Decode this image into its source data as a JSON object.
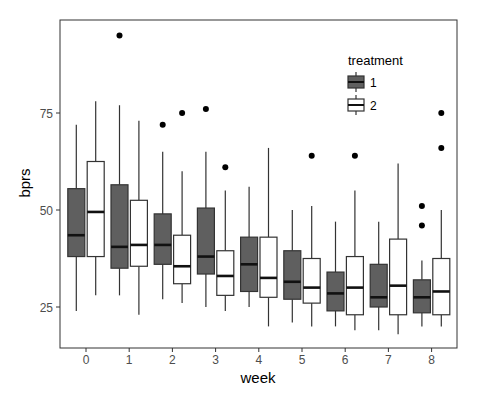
{
  "chart_data": {
    "type": "boxplot",
    "title": "",
    "xlabel": "week",
    "ylabel": "bprs",
    "categories": [
      "0",
      "1",
      "2",
      "3",
      "4",
      "5",
      "6",
      "7",
      "8"
    ],
    "y_ticks": [
      25,
      50,
      75
    ],
    "ylim": [
      15,
      100
    ],
    "grid": false,
    "legend": {
      "title": "treatment",
      "position": "top-right-inside",
      "entries": [
        {
          "label": "1",
          "fill": "#5f5f5f"
        },
        {
          "label": "2",
          "fill": "#ffffff"
        }
      ]
    },
    "series": [
      {
        "name": "1",
        "fill": "#5f5f5f",
        "boxes": [
          {
            "week": "0",
            "whisker_low": 24,
            "q1": 38,
            "median": 43.5,
            "q3": 55.5,
            "whisker_high": 72,
            "outliers": []
          },
          {
            "week": "1",
            "whisker_low": 28,
            "q1": 35,
            "median": 40.5,
            "q3": 56.5,
            "whisker_high": 77,
            "outliers": [
              95
            ]
          },
          {
            "week": "2",
            "whisker_low": 27,
            "q1": 36,
            "median": 41,
            "q3": 49,
            "whisker_high": 65,
            "outliers": [
              72
            ]
          },
          {
            "week": "3",
            "whisker_low": 25,
            "q1": 33.5,
            "median": 38,
            "q3": 50.5,
            "whisker_high": 65,
            "outliers": [
              76
            ]
          },
          {
            "week": "4",
            "whisker_low": 25,
            "q1": 29,
            "median": 36,
            "q3": 43,
            "whisker_high": 56,
            "outliers": []
          },
          {
            "week": "5",
            "whisker_low": 21,
            "q1": 27,
            "median": 31.5,
            "q3": 39.5,
            "whisker_high": 50,
            "outliers": []
          },
          {
            "week": "6",
            "whisker_low": 20,
            "q1": 24,
            "median": 28.5,
            "q3": 34,
            "whisker_high": 47,
            "outliers": []
          },
          {
            "week": "7",
            "whisker_low": 19,
            "q1": 25,
            "median": 27.5,
            "q3": 36,
            "whisker_high": 47,
            "outliers": []
          },
          {
            "week": "8",
            "whisker_low": 20,
            "q1": 23.5,
            "median": 27.5,
            "q3": 32,
            "whisker_high": 37,
            "outliers": [
              46,
              51
            ]
          }
        ]
      },
      {
        "name": "2",
        "fill": "#ffffff",
        "boxes": [
          {
            "week": "0",
            "whisker_low": 28,
            "q1": 38,
            "median": 49.5,
            "q3": 62.5,
            "whisker_high": 78,
            "outliers": []
          },
          {
            "week": "1",
            "whisker_low": 23,
            "q1": 35.5,
            "median": 41,
            "q3": 52.5,
            "whisker_high": 73,
            "outliers": []
          },
          {
            "week": "2",
            "whisker_low": 26,
            "q1": 31,
            "median": 35.5,
            "q3": 43.5,
            "whisker_high": 60,
            "outliers": [
              75
            ]
          },
          {
            "week": "3",
            "whisker_low": 24,
            "q1": 28,
            "median": 33,
            "q3": 39.5,
            "whisker_high": 55,
            "outliers": [
              61
            ]
          },
          {
            "week": "4",
            "whisker_low": 20,
            "q1": 27.5,
            "median": 32.5,
            "q3": 43,
            "whisker_high": 66,
            "outliers": []
          },
          {
            "week": "5",
            "whisker_low": 20,
            "q1": 26,
            "median": 30,
            "q3": 37.5,
            "whisker_high": 51,
            "outliers": [
              64
            ]
          },
          {
            "week": "6",
            "whisker_low": 19,
            "q1": 23,
            "median": 30,
            "q3": 38,
            "whisker_high": 55,
            "outliers": [
              64
            ]
          },
          {
            "week": "7",
            "whisker_low": 18,
            "q1": 23,
            "median": 30.5,
            "q3": 42.5,
            "whisker_high": 62,
            "outliers": []
          },
          {
            "week": "8",
            "whisker_low": 20,
            "q1": 23,
            "median": 29,
            "q3": 37.5,
            "whisker_high": 50,
            "outliers": [
              66,
              75
            ]
          }
        ]
      }
    ]
  }
}
